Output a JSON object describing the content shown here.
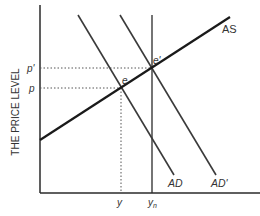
{
  "diagram": {
    "type": "AD-AS model",
    "y_axis_label": "THE PRICE LEVEL",
    "x_axis_label": "",
    "curves": {
      "as": "AS",
      "ad": "AD",
      "ad_prime": "AD'"
    },
    "points": {
      "e": "e",
      "e_prime": "e'"
    },
    "y_ticks": {
      "p_prime": "p'",
      "p": "p"
    },
    "x_ticks": {
      "y": "y",
      "yn": "y",
      "yn_sub": "n"
    },
    "colors": {
      "line": "#2a2a2a",
      "text": "#333333",
      "dotted": "#555555"
    }
  }
}
